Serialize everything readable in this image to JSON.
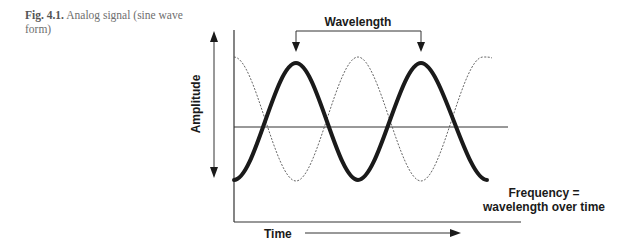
{
  "caption": {
    "label": "Fig. 4.1.",
    "text": " Analog signal (sine wave form)"
  },
  "diagram": {
    "title": "Analog signal (sine wave form)",
    "wavelength_label": "Wavelength",
    "amplitude_label": "Amplitude",
    "time_label": "Time",
    "frequency_label_line1": "Frequency =",
    "frequency_label_line2": "wavelength over time",
    "colors": {
      "solid_wave": "#1a1a1a",
      "dashed_wave": "#555555",
      "axis": "#333333",
      "caption": "#6e6e6e"
    },
    "series": [
      {
        "name": "solid sine wave",
        "style": "thick solid",
        "cycles": 2,
        "phase": "starts at trough"
      },
      {
        "name": "dashed sine wave",
        "style": "thin dashed",
        "cycles": 2,
        "phase": "starts at peak"
      }
    ]
  }
}
